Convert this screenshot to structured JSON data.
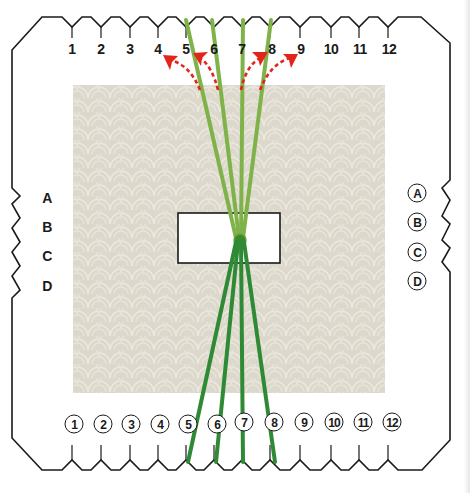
{
  "diagram": {
    "colors": {
      "outline": "#1a1a1a",
      "fabric": "#dcd8cc",
      "fabric_pattern": "#ece9e0",
      "strand_light": "#7fb34a",
      "strand_dark": "#2f8a35",
      "arrow": "#e3241b",
      "card_fill": "#ffffff"
    },
    "top_labels": [
      "1",
      "2",
      "3",
      "4",
      "5",
      "6",
      "7",
      "8",
      "9",
      "10",
      "11",
      "12"
    ],
    "bottom_labels": [
      "1",
      "2",
      "3",
      "4",
      "5",
      "6",
      "7",
      "8",
      "9",
      "10",
      "11",
      "12"
    ],
    "left_labels": [
      "A",
      "B",
      "C",
      "D"
    ],
    "right_labels": [
      "A",
      "B",
      "C",
      "D"
    ],
    "arrows": [
      {
        "from_slot": "5",
        "to_slot": "4",
        "direction": "left"
      },
      {
        "from_slot": "6",
        "to_slot": "5",
        "direction": "left"
      },
      {
        "from_slot": "7",
        "to_slot": "8",
        "direction": "right"
      },
      {
        "from_slot": "8",
        "to_slot": "9",
        "direction": "right"
      }
    ],
    "strands": {
      "top_slots": [
        "5",
        "6",
        "7",
        "8"
      ],
      "bottom_slots": [
        "5",
        "6",
        "7",
        "8"
      ],
      "gathered_at": "center-card"
    }
  }
}
